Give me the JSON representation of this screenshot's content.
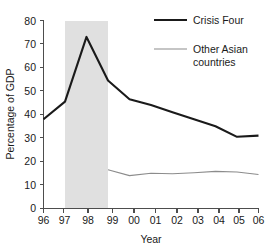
{
  "chart_data": {
    "type": "line",
    "title": "",
    "xlabel": "Year",
    "ylabel": "Percentage of GDP",
    "x": [
      "96",
      "97",
      "98",
      "99",
      "00",
      "01",
      "02",
      "03",
      "04",
      "05",
      "06"
    ],
    "xlim": [
      1996,
      2006
    ],
    "ylim": [
      0,
      80
    ],
    "yticks": [
      0,
      10,
      20,
      30,
      40,
      50,
      60,
      70,
      80
    ],
    "xticks": [
      "96",
      "97",
      "98",
      "99",
      "00",
      "01",
      "02",
      "03",
      "04",
      "05",
      "06"
    ],
    "grid": false,
    "legend_position": "top-right",
    "series": [
      {
        "name": "Crisis Four",
        "color": "#1a1a1a",
        "linewidth": "thick",
        "x": [
          "96",
          "97",
          "98",
          "99",
          "00",
          "01",
          "02",
          "03",
          "04",
          "05",
          "06"
        ],
        "values": [
          38,
          45.5,
          73,
          54.5,
          46.5,
          44,
          41,
          38,
          35,
          30.5,
          31
        ]
      },
      {
        "name": "Other Asian countries",
        "color": "#8c8c8c",
        "linewidth": "thin",
        "x": [
          "99",
          "00",
          "01",
          "02",
          "03",
          "04",
          "05",
          "06"
        ],
        "values": [
          16.5,
          14,
          15,
          14.8,
          15.2,
          15.8,
          15.5,
          14.5
        ]
      }
    ],
    "shaded_region": {
      "label": "",
      "x_start": "97",
      "x_end": "99",
      "color": "#e0e0e0"
    },
    "annotations": []
  },
  "legend": {
    "entries": [
      {
        "label": "Crisis Four"
      },
      {
        "label": "Other Asian"
      },
      {
        "label": "countries"
      }
    ]
  },
  "axes": {
    "y_title": "Percentage of GDP",
    "x_title": "Year",
    "y_tick_labels": [
      "80",
      "70",
      "60",
      "50",
      "40",
      "30",
      "20",
      "10",
      "0"
    ],
    "x_tick_labels": [
      "96",
      "97",
      "98",
      "99",
      "00",
      "01",
      "02",
      "03",
      "04",
      "05",
      "06"
    ]
  }
}
